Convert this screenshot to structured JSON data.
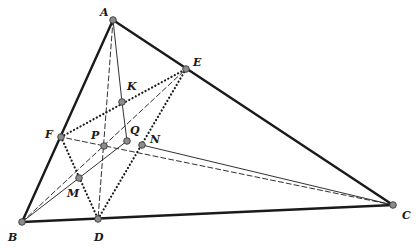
{
  "figure": {
    "kind": "geometry-diagram"
  },
  "points": {
    "A": {
      "label": "A",
      "x": 113,
      "y": 20,
      "lx": 100,
      "ly": 16
    },
    "B": {
      "label": "B",
      "x": 22,
      "y": 222,
      "lx": 8,
      "ly": 241
    },
    "C": {
      "label": "C",
      "x": 393,
      "y": 205,
      "lx": 402,
      "ly": 219
    },
    "D": {
      "label": "D",
      "x": 98,
      "y": 219,
      "lx": 94,
      "ly": 241
    },
    "E": {
      "label": "E",
      "x": 186,
      "y": 69,
      "lx": 193,
      "ly": 66
    },
    "F": {
      "label": "F",
      "x": 61,
      "y": 137,
      "lx": 45,
      "ly": 138
    },
    "K": {
      "label": "K",
      "x": 122,
      "y": 102,
      "lx": 127,
      "ly": 90
    },
    "P": {
      "label": "P",
      "x": 104,
      "y": 146,
      "lx": 91,
      "ly": 139
    },
    "Q": {
      "label": "Q",
      "x": 127,
      "y": 141,
      "lx": 130,
      "ly": 134
    },
    "N": {
      "label": "N",
      "x": 142,
      "y": 145,
      "lx": 150,
      "ly": 143
    },
    "M": {
      "label": "M",
      "x": 79,
      "y": 178,
      "lx": 67,
      "ly": 197
    }
  },
  "segments": {
    "thick": [
      [
        "A",
        "B"
      ],
      [
        "B",
        "C"
      ],
      [
        "C",
        "A"
      ]
    ],
    "dotted": [
      [
        "F",
        "E"
      ],
      [
        "F",
        "D"
      ],
      [
        "D",
        "E"
      ]
    ],
    "dashed": [
      [
        "A",
        "D"
      ],
      [
        "B",
        "E"
      ],
      [
        "C",
        "F"
      ]
    ],
    "thin": [
      [
        "A",
        "K"
      ],
      [
        "K",
        "Q"
      ],
      [
        "B",
        "Q"
      ],
      [
        "N",
        "C"
      ]
    ]
  },
  "style": {
    "line_color": "#1a1a1a",
    "point_fill": "#8c8c8c",
    "point_stroke": "#3a3a3a"
  }
}
